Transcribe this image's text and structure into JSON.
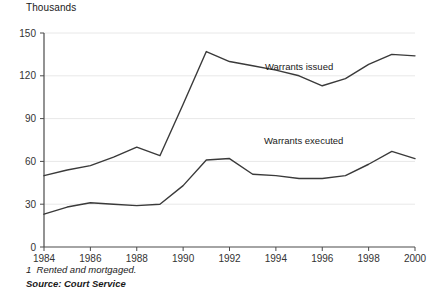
{
  "chart_data": {
    "type": "line",
    "title": "",
    "subtitle": "",
    "unit_label": "Thousands",
    "xlabel": "",
    "ylabel": "",
    "x": [
      1984,
      1985,
      1986,
      1987,
      1988,
      1989,
      1990,
      1991,
      1992,
      1993,
      1994,
      1995,
      1996,
      1997,
      1998,
      1999,
      2000
    ],
    "xlim": [
      1984,
      2000
    ],
    "ylim": [
      0,
      150
    ],
    "yticks": [
      0,
      30,
      60,
      90,
      120,
      150
    ],
    "ytick_labels": [
      "0",
      "30",
      "60",
      "90",
      "120",
      "150"
    ],
    "xticks": [
      1984,
      1986,
      1988,
      1990,
      1992,
      1994,
      1996,
      1998,
      2000
    ],
    "xtick_labels": [
      "1984",
      "1986",
      "1988",
      "1990",
      "1992",
      "1994",
      "1996",
      "1998",
      "2000"
    ],
    "grid": true,
    "grid_axis": "y",
    "legend": "inline-annotations",
    "series": [
      {
        "name": "Warrants issued",
        "label": "Warrants issued",
        "color": "#3a3a3a",
        "annotation_x": 1995.0,
        "annotation_y": 124,
        "values": [
          50,
          54,
          57,
          63,
          70,
          64,
          100,
          137,
          130,
          127,
          124,
          120,
          113,
          118,
          128,
          135,
          134
        ]
      },
      {
        "name": "Warrants executed",
        "label": "Warrants executed",
        "color": "#3a3a3a",
        "annotation_x": 1995.2,
        "annotation_y": 72,
        "values": [
          23,
          28,
          31,
          30,
          29,
          30,
          43,
          61,
          62,
          51,
          50,
          48,
          48,
          50,
          58,
          67,
          62
        ]
      }
    ]
  },
  "footnotes": {
    "marker": "1",
    "note": "Rented and mortgaged.",
    "source": "Source: Court Service"
  },
  "icons": {
    "axis_tick": "tick-mark"
  },
  "colors": {
    "line": "#3a3a3a",
    "grid": "#e8e8e8",
    "axis": "#4a4a4a",
    "text": "#1a1a1a"
  }
}
